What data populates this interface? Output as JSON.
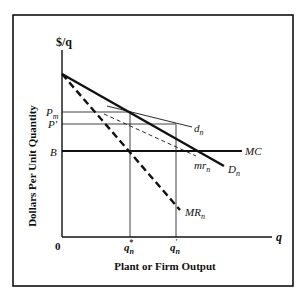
{
  "diagram": {
    "y_axis_label": "$/q",
    "y_axis_title": "Dollars Per Unit Quantity",
    "x_axis_label": "q",
    "x_axis_title": "Plant or Firm Output",
    "origin_label": "0",
    "price_labels": {
      "pm": "P",
      "pm_sub": "m",
      "p_prime": "P'",
      "b": "B"
    },
    "quantity_labels": {
      "q_star": "q",
      "q_star_sub": "n",
      "q_star_sup": "*",
      "q_prime": "q",
      "q_prime_sub": "n",
      "q_prime_sup": "'"
    },
    "curves": {
      "demand_market": {
        "name": "D",
        "sub": "n"
      },
      "demand_firm": {
        "name": "d",
        "sub": "n"
      },
      "marginal_revenue_market": {
        "name": "MR",
        "sub": "n"
      },
      "marginal_revenue_firm": {
        "name": "mr",
        "sub": "n"
      },
      "marginal_cost": {
        "name": "MC"
      }
    },
    "colors": {
      "line": "#111111",
      "frame": "#111111",
      "background": "#ffffff"
    }
  }
}
